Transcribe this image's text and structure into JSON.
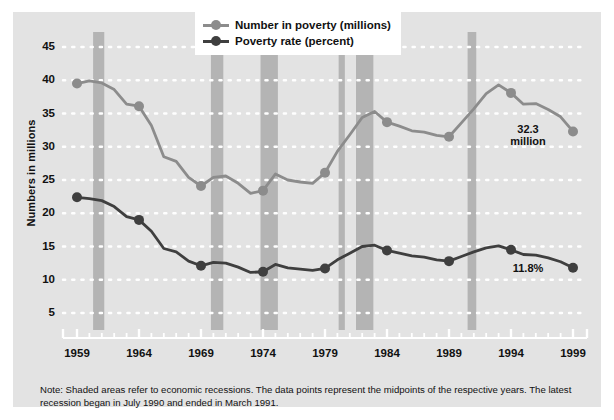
{
  "chart_data": {
    "type": "line",
    "title": "",
    "xlabel": "",
    "ylabel": "Numbers in millions",
    "ylim": [
      0,
      47
    ],
    "xlim": [
      1959,
      1999
    ],
    "grid": "horizontal-dotted-white",
    "legend_position": "top-center",
    "y_ticks": [
      45,
      40,
      35,
      30,
      25,
      20,
      15,
      10,
      5
    ],
    "x_ticks": [
      1959,
      1964,
      1969,
      1974,
      1979,
      1984,
      1989,
      1994,
      1999
    ],
    "x_minor_tick_interval": 1,
    "x": [
      1959,
      1960,
      1961,
      1962,
      1963,
      1964,
      1965,
      1966,
      1967,
      1968,
      1969,
      1970,
      1971,
      1972,
      1973,
      1974,
      1975,
      1976,
      1977,
      1978,
      1979,
      1980,
      1981,
      1982,
      1983,
      1984,
      1985,
      1986,
      1987,
      1988,
      1989,
      1990,
      1991,
      1992,
      1993,
      1994,
      1995,
      1996,
      1997,
      1998,
      1999
    ],
    "series": [
      {
        "name": "Number in poverty (millions)",
        "color": "#8c8c8c",
        "marker_years": [
          1959,
          1964,
          1969,
          1974,
          1979,
          1984,
          1989,
          1994,
          1999
        ],
        "values": [
          39.5,
          39.9,
          39.6,
          38.6,
          36.4,
          36.1,
          33.2,
          28.5,
          27.8,
          25.4,
          24.1,
          25.4,
          25.6,
          24.5,
          23.0,
          23.4,
          25.9,
          25.0,
          24.7,
          24.5,
          26.1,
          29.3,
          31.8,
          34.4,
          35.3,
          33.7,
          33.1,
          32.4,
          32.2,
          31.7,
          31.5,
          33.6,
          35.7,
          38.0,
          39.3,
          38.1,
          36.4,
          36.5,
          35.6,
          34.5,
          32.3
        ],
        "end_label": "32.3\nmillion"
      },
      {
        "name": "Poverty rate (percent)",
        "color": "#3f3f3f",
        "marker_years": [
          1959,
          1964,
          1969,
          1974,
          1979,
          1984,
          1989,
          1994,
          1999
        ],
        "values": [
          22.4,
          22.2,
          21.9,
          21.0,
          19.5,
          19.0,
          17.3,
          14.7,
          14.2,
          12.8,
          12.1,
          12.6,
          12.5,
          11.9,
          11.1,
          11.2,
          12.3,
          11.8,
          11.6,
          11.4,
          11.7,
          13.0,
          14.0,
          15.0,
          15.2,
          14.4,
          14.0,
          13.6,
          13.4,
          13.0,
          12.8,
          13.5,
          14.2,
          14.8,
          15.1,
          14.5,
          13.8,
          13.7,
          13.3,
          12.7,
          11.8
        ],
        "end_label": "11.8%"
      }
    ],
    "recession_bands": [
      {
        "start": 1960.3,
        "end": 1961.2
      },
      {
        "start": 1969.8,
        "end": 1970.8
      },
      {
        "start": 1973.8,
        "end": 1975.2
      },
      {
        "start": 1980.1,
        "end": 1980.6
      },
      {
        "start": 1981.5,
        "end": 1982.9
      },
      {
        "start": 1990.5,
        "end": 1991.2
      }
    ],
    "recession_band_color": "#b4b4b4",
    "annotations": [
      {
        "text": "32.3\nmillion",
        "series": "Number in poverty (millions)",
        "year": 1999,
        "value": 32.3
      },
      {
        "text": "11.8%",
        "series": "Poverty rate (percent)",
        "year": 1999,
        "value": 11.8
      }
    ]
  },
  "legend": {
    "items": [
      {
        "label": "Number in poverty (millions)",
        "color": "#8c8c8c"
      },
      {
        "label": "Poverty rate (percent)",
        "color": "#3f3f3f"
      }
    ]
  },
  "axis": {
    "y_title": "Numbers in millions",
    "y_labels": [
      "45",
      "40",
      "35",
      "30",
      "25",
      "20",
      "15",
      "10",
      "5"
    ],
    "x_labels": [
      "1959",
      "1964",
      "1969",
      "1974",
      "1979",
      "1984",
      "1989",
      "1994",
      "1999"
    ]
  },
  "annotations": {
    "poverty_number_end": "32.3\nmillion",
    "poverty_rate_end": "11.8%"
  },
  "note": {
    "text": "Note: Shaded areas refer to economic recessions. The data points represent the midpoints of the respective years. The latest recession began in July 1990 and ended in March 1991."
  },
  "colors": {
    "panel_background": "#e3e3e3",
    "page_background": "#ffffff",
    "gridline": "#ffffff",
    "recession_band": "#b4b4b4",
    "series_light": "#8c8c8c",
    "series_dark": "#3f3f3f",
    "text": "#111111"
  }
}
